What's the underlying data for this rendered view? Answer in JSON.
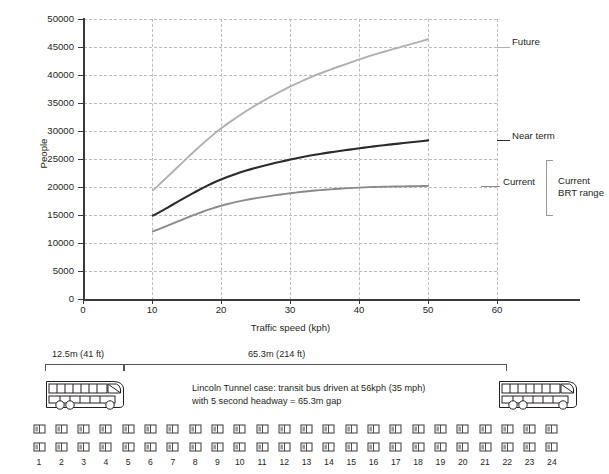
{
  "chart_data": {
    "type": "line",
    "title": "",
    "xlabel": "Traffic speed (kph)",
    "ylabel": "People",
    "xlim": [
      0,
      60
    ],
    "ylim": [
      0,
      50000
    ],
    "x": [
      10,
      20,
      30,
      40,
      50
    ],
    "xticks": [
      "0",
      "10",
      "20",
      "30",
      "40",
      "50",
      "60"
    ],
    "yticks": [
      "0",
      "5000",
      "10000",
      "15000",
      "20000",
      "25000",
      "30000",
      "35000",
      "40000",
      "45000",
      "50000"
    ],
    "grid": true,
    "legend_position": "inline-right-end-labels",
    "series": [
      {
        "name": "Future",
        "color": "#b0b0b0",
        "values": [
          19500,
          30600,
          38000,
          42800,
          46400
        ]
      },
      {
        "name": "Near term",
        "color": "#2b2b2b",
        "values": [
          15000,
          21500,
          25000,
          27000,
          28400
        ]
      },
      {
        "name": "Current",
        "color": "#8a8a8a",
        "values": [
          12200,
          16800,
          19000,
          20000,
          20300
        ]
      }
    ],
    "annotations": [
      {
        "name": "future-label",
        "text": "Future"
      },
      {
        "name": "near-term-label",
        "text": "Near term"
      },
      {
        "name": "current-label",
        "text": "Current"
      },
      {
        "name": "brt-range-label",
        "text": "Current\nBRT range",
        "line1": "Current",
        "line2": "BRT range"
      }
    ]
  },
  "chart": {
    "ylabel": "People",
    "xlabel": "Traffic speed (kph)",
    "yticks": [
      "50000",
      "45000",
      "40000",
      "35000",
      "30000",
      "25000",
      "20000",
      "15000",
      "10000",
      "5000",
      "0"
    ],
    "xticks": [
      "0",
      "10",
      "20",
      "30",
      "40",
      "50",
      "60"
    ],
    "labels": {
      "future": "Future",
      "near_term": "Near term",
      "current": "Current",
      "brt_range_line1": "Current",
      "brt_range_line2": "BRT range"
    }
  },
  "diagram": {
    "dim_bus": "12.5m (41 ft)",
    "dim_gap": "65.3m (214 ft)",
    "note_line1": "Lincoln Tunnel case: transit bus driven at 56kph (35 mph)",
    "note_line2": "with 5 second headway = 65.3m gap",
    "car_numbers": [
      "1",
      "2",
      "3",
      "4",
      "5",
      "6",
      "7",
      "8",
      "9",
      "10",
      "11",
      "12",
      "13",
      "14",
      "15",
      "16",
      "17",
      "18",
      "19",
      "20",
      "21",
      "22",
      "23",
      "24"
    ]
  },
  "colors": {
    "future": "#b0b0b0",
    "near_term": "#2b2b2b",
    "current": "#8a8a8a",
    "grid": "#bdbdbd",
    "axis": "#3a3a3a",
    "text": "#231f20"
  }
}
